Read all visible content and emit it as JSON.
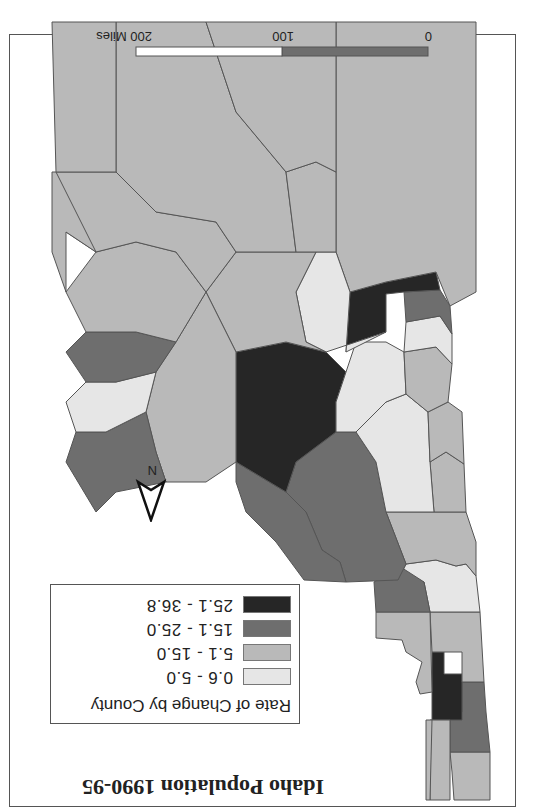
{
  "title": "Idaho Population 1990-95",
  "legend": {
    "title": "Rate of Change by County",
    "classes": [
      {
        "label": "0.6 - 5.0",
        "color": "#e6e6e6"
      },
      {
        "label": "5.1 - 15.0",
        "color": "#b9b9b9"
      },
      {
        "label": "15.1 - 25.0",
        "color": "#6e6e6e"
      },
      {
        "label": "25.1 - 36.8",
        "color": "#262626"
      }
    ]
  },
  "north_arrow": {
    "label": "N"
  },
  "scale_bar": {
    "labels": [
      "0",
      "100",
      "200 Miles"
    ],
    "segment_colors": [
      "#6e6e6e",
      "#ffffff"
    ]
  },
  "colors": {
    "outline": "#555555",
    "c1": "#e6e6e6",
    "c2": "#b9b9b9",
    "c3": "#6e6e6e",
    "c4": "#262626"
  },
  "orientation": "rotated 180 degrees"
}
